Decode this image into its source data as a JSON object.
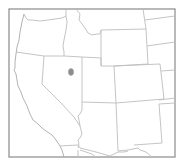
{
  "map": {
    "type": "outline-map",
    "region": "Western United States",
    "frame": {
      "x": 9,
      "y": 9,
      "width": 166,
      "height": 148,
      "stroke_color": "#8a8a8a"
    },
    "colors": {
      "background": "#ffffff",
      "state_border": "#bdbdbd",
      "marker": "#8c8c8c"
    },
    "markers": [
      {
        "name": "location-marker",
        "x": 71,
        "y": 72,
        "rx": 2.6,
        "ry": 3.4,
        "color": "#8c8c8c"
      }
    ]
  }
}
